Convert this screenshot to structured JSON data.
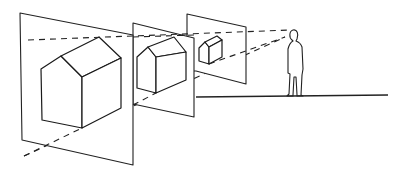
{
  "diagram": {
    "title": "Perspective projection: picture planes between viewer and object",
    "colors": {
      "line": "#222222",
      "background": "#ffffff"
    },
    "elements": {
      "observer": "standing-person-figure",
      "ground_line": "horizon-ground-line",
      "sight_lines": [
        "upper-sight-line",
        "lower-sight-line"
      ],
      "picture_planes": [
        {
          "id": "plane-front",
          "label": "largest picture plane (farthest from viewer)",
          "house_scale": "large"
        },
        {
          "id": "plane-middle",
          "label": "middle picture plane",
          "house_scale": "medium"
        },
        {
          "id": "plane-back",
          "label": "nearest picture plane to viewer",
          "house_scale": "small"
        }
      ]
    }
  }
}
